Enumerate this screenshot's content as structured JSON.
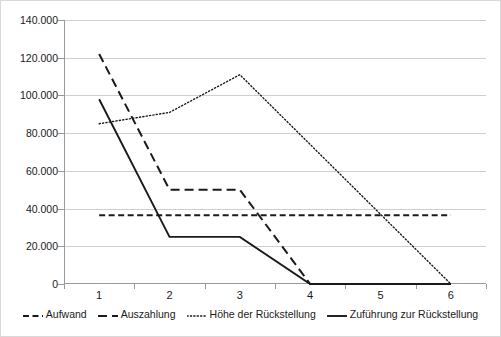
{
  "chart_data": {
    "type": "line",
    "title": "",
    "xlabel": "",
    "ylabel": "",
    "categories": [
      "1",
      "2",
      "3",
      "4",
      "5",
      "6"
    ],
    "ylim": [
      0,
      140000
    ],
    "ytick_values": [
      0,
      20000,
      40000,
      60000,
      80000,
      100000,
      120000,
      140000
    ],
    "ytick_labels": [
      "0",
      "20.000",
      "40.000",
      "60.000",
      "80.000",
      "100.000",
      "120.000",
      "140.000"
    ],
    "grid": true,
    "legend_position": "bottom",
    "series": [
      {
        "name": "Aufwand",
        "style": "short-dash",
        "color": "#1a1a1a",
        "values": [
          36500,
          36500,
          36500,
          36500,
          36500,
          36500
        ]
      },
      {
        "name": "Auszahlung",
        "style": "long-dash",
        "color": "#1a1a1a",
        "values": [
          122000,
          50000,
          50000,
          0,
          0,
          0
        ]
      },
      {
        "name": "Höhe der Rückstellung",
        "style": "dotted",
        "color": "#1a1a1a",
        "values": [
          85000,
          91000,
          111000,
          74000,
          37000,
          0
        ]
      },
      {
        "name": "Zuführung zur Rückstellung",
        "style": "solid",
        "color": "#1a1a1a",
        "values": [
          98000,
          25000,
          25000,
          0,
          0,
          0
        ]
      }
    ]
  },
  "legend": {
    "items": [
      {
        "label": "Aufwand"
      },
      {
        "label": "Auszahlung"
      },
      {
        "label": "Höhe der Rückstellung"
      },
      {
        "label": "Zuführung zur Rückstellung"
      }
    ]
  }
}
